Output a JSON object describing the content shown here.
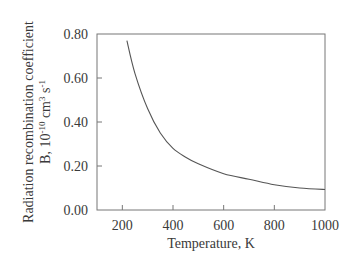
{
  "chart_data": {
    "type": "line",
    "title": "",
    "xlabel": "Temperature, K",
    "ylabel": "Radiation recombination coefficient",
    "ylabel_line2": "B, 10^-10 cm^3 s^-1",
    "ylabel_line2_parts": {
      "prefix": "B, 10",
      "exp1": "-10",
      "mid": " cm",
      "exp2": "3",
      "mid2": " s",
      "exp3": "-1"
    },
    "xlim": [
      100,
      1000
    ],
    "ylim": [
      0.0,
      0.8
    ],
    "xticks": [
      200,
      400,
      600,
      800,
      1000
    ],
    "xtick_labels": [
      "200",
      "400",
      "600",
      "800",
      "1000"
    ],
    "yticks": [
      0.0,
      0.2,
      0.4,
      0.6,
      0.8
    ],
    "ytick_labels": [
      "0.00",
      "0.20",
      "0.40",
      "0.60",
      "0.80"
    ],
    "grid": false,
    "legend": null,
    "series": [
      {
        "name": "B(T)",
        "color": "#555555",
        "x": [
          218,
          250,
          300,
          350,
          400,
          450,
          500,
          600,
          700,
          800,
          900,
          1000
        ],
        "y": [
          0.77,
          0.62,
          0.46,
          0.35,
          0.28,
          0.24,
          0.21,
          0.165,
          0.14,
          0.115,
          0.1,
          0.093
        ]
      }
    ]
  }
}
